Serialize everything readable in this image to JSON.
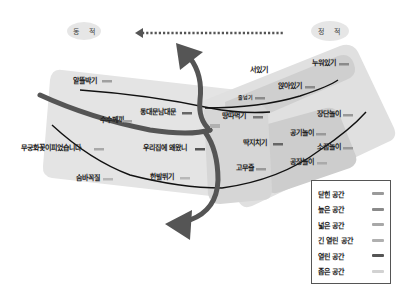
{
  "ovals": {
    "dynamic": "동 적",
    "static": "정 적"
  },
  "direction_arrow": {
    "from": "정 적",
    "to": "동 적",
    "style": "dotted"
  },
  "labels": {
    "alttakbakgi": "알뜰박기",
    "dongdaemun": "동대문남대문",
    "susumgi": "수수께끼",
    "mugunghwa": "무궁화꽃이피었습니다",
    "uri_jip": "우리집에 왜왔니",
    "sumbakkokjil": "숨바꼭질",
    "hanbal": "한발뛰기",
    "seolgi": "서있기",
    "nuwoitgi": "누워있기",
    "anjaitgi": "앉아있기",
    "small_line": "줄넘기",
    "ttangtta": "땅따먹기",
    "ttakji": "딱지치기",
    "gomujul": "고무줄",
    "jeonhwa": "전화기",
    "gonggi": "공기놀이",
    "somgkkup": "소꿉놀이",
    "jangdan": "장단놀이",
    "gonjang": "공장놀이"
  },
  "legend": {
    "items": [
      {
        "label": "닫힌 공간",
        "color": "#9a9a9a"
      },
      {
        "label": "높은 공간",
        "color": "#8a8a8a"
      },
      {
        "label": "넓은 공간",
        "color": "#a8a8a8"
      },
      {
        "label": "긴 열린 공간",
        "color": "#b0b0b0"
      },
      {
        "label": "열린 공간",
        "color": "#555555"
      },
      {
        "label": "좁은 공간",
        "color": "#d2d2d2"
      }
    ]
  },
  "colors": {
    "region_light": "#e3e3e3",
    "region_mid": "#d0d0d0",
    "region_dark": "#bdbdbd",
    "thick_arrow": "#555555",
    "thin_line": "#111111",
    "oval": "#e6e6e6"
  }
}
